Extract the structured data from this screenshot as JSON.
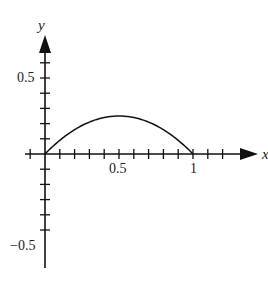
{
  "chart_data": {
    "type": "line",
    "title": "",
    "xlabel": "x",
    "ylabel": "y",
    "function": "y = x(1 - x)",
    "series": [
      {
        "name": "curve",
        "x": [
          0,
          0.1,
          0.2,
          0.3,
          0.4,
          0.5,
          0.6,
          0.7,
          0.8,
          0.9,
          1.0
        ],
        "values": [
          0,
          0.09,
          0.16,
          0.21,
          0.24,
          0.25,
          0.24,
          0.21,
          0.16,
          0.09,
          0
        ]
      }
    ],
    "xlim": [
      -0.1,
      1.3
    ],
    "ylim": [
      -0.7,
      0.8
    ],
    "x_tick_step": 0.1,
    "y_tick_step": 0.1,
    "x_tick_labels": [
      {
        "value": 0.5,
        "label": "0.5"
      },
      {
        "value": 1,
        "label": "1"
      }
    ],
    "y_tick_labels": [
      {
        "value": 0.5,
        "label": "0.5"
      },
      {
        "value": -0.5,
        "label": "−0.5"
      }
    ],
    "grid": false,
    "legend": null,
    "colors": {
      "axis": "#111111",
      "curve": "#111111"
    }
  },
  "labels": {
    "x_axis": "x",
    "y_axis": "y",
    "x_half": "0.5",
    "x_one": "1",
    "y_half": "0.5",
    "y_neg_half": "−0.5"
  }
}
